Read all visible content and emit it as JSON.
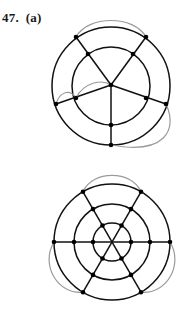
{
  "problem": {
    "number": "47.",
    "part": "(a)",
    "label": "47.  (a)"
  },
  "colors": {
    "edge": "#111111",
    "extra_edge": "#9a9a9a",
    "node": "#000000",
    "background": "#ffffff"
  },
  "figures": [
    {
      "name": "wheel-graph-two-rings",
      "description": "Two concentric circles with a central hub and five spokes; gray curved edges added",
      "center": [
        111,
        86
      ],
      "rings": [
        {
          "r": 59
        },
        {
          "r": 39
        }
      ],
      "nodes": [
        [
          111,
          85
        ],
        [
          88,
          54
        ],
        [
          76,
          37
        ],
        [
          133,
          54
        ],
        [
          146,
          37
        ],
        [
          76,
          98
        ],
        [
          56,
          104
        ],
        [
          146,
          98
        ],
        [
          166,
          104
        ],
        [
          111,
          125
        ],
        [
          111,
          145
        ]
      ],
      "extra_edges": 4
    },
    {
      "name": "web-graph-three-rings",
      "description": "Three concentric circles crossed by three diameters; gray curved edges on outer ring",
      "center": [
        112,
        242
      ],
      "rings": [
        {
          "r": 58
        },
        {
          "r": 38
        },
        {
          "r": 19
        }
      ],
      "nodes_per_ring": 6,
      "extra_edges": 3
    }
  ]
}
